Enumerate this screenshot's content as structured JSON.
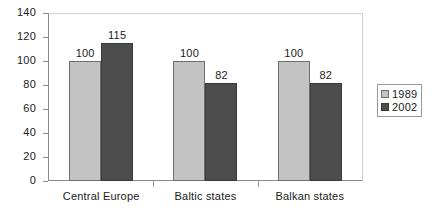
{
  "chart_data": {
    "type": "bar",
    "title": "",
    "subtitle": "",
    "xlabel": "",
    "ylabel": "",
    "categories": [
      "Central Europe",
      "Baltic states",
      "Balkan states"
    ],
    "series": [
      {
        "name": "1989",
        "values": [
          100,
          100,
          100
        ],
        "color": "#c3c3c3"
      },
      {
        "name": "2002",
        "values": [
          115,
          82,
          82
        ],
        "color": "#4d4d4d"
      }
    ],
    "data_labels": [
      [
        "100",
        "115"
      ],
      [
        "100",
        "82"
      ],
      [
        "100",
        "82"
      ]
    ],
    "ylim": [
      0,
      140
    ],
    "ytick_values": [
      0,
      20,
      40,
      60,
      80,
      100,
      120,
      140
    ],
    "ytick_labels": [
      "0",
      "20",
      "40",
      "60",
      "80",
      "100",
      "120",
      "140"
    ],
    "grid": false,
    "legend_position": "right",
    "legend_entries": [
      "1989",
      "2002"
    ]
  },
  "colors": {
    "series_1989": "#c3c3c3",
    "series_2002": "#4d4d4d",
    "axis": "#8a8a8a",
    "text": "#1a1a1a",
    "background": "#ffffff"
  }
}
